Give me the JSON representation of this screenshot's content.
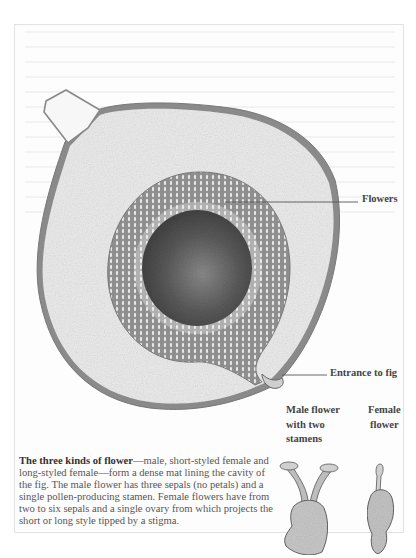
{
  "illustration": {
    "subject": "Cross-section of a fig",
    "labels": {
      "flowers": "Flowers",
      "entrance": "Entrance to fig",
      "male_flower": [
        "Male flower",
        "with two",
        "stamens"
      ],
      "female_flower": [
        "Female",
        "flower"
      ]
    },
    "colors": {
      "skin": "#8a8a8a",
      "flesh": "#ececec",
      "flower_ring": "#9a9a9a",
      "cavity": "#555555",
      "leader_line": "#555555"
    }
  },
  "caption": {
    "bold_lead": "The three kinds of flower",
    "body": "—male, short-styled female and long-styled female—form a dense mat lining the cavity of the fig. The male flower has three sepals (no petals) and a single pollen-producing stamen. Female flowers have from two to six sepals and a single ovary from which projects the short or long style tipped by a stigma."
  }
}
